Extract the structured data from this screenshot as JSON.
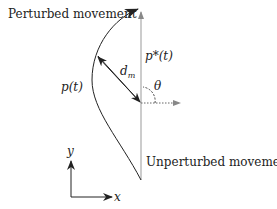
{
  "diagram": {
    "labels": {
      "perturbed": "Perturbed movement",
      "unperturbed": "Unperturbed movement",
      "p_star_t": "p*(t)",
      "p_t": "p(t)",
      "d_m_base": "d",
      "d_m_sub": "m",
      "theta": "θ",
      "y_axis": "y",
      "x_axis": "x"
    },
    "colors": {
      "stroke": "#222222",
      "reference_line": "#999999"
    }
  }
}
